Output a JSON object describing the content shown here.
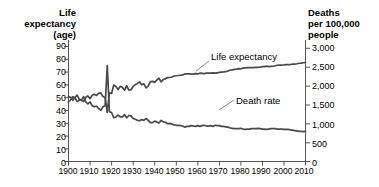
{
  "left_axis": {
    "header_lines": [
      "Life",
      "expectancy",
      "(age)"
    ],
    "ticks": [
      "90",
      "80",
      "70",
      "60",
      "50",
      "40",
      "30",
      "20",
      "10",
      "0"
    ]
  },
  "right_axis": {
    "header_lines": [
      "Deaths",
      "per 100,000",
      "people"
    ],
    "ticks": [
      "3,000",
      "2,500",
      "2,000",
      "1,500",
      "1,000",
      "500",
      "0"
    ]
  },
  "x_axis": {
    "ticks": [
      "1900",
      "1910",
      "1920",
      "1930",
      "1940",
      "1950",
      "1960",
      "1970",
      "1980",
      "1990",
      "2000",
      "2010"
    ]
  },
  "annotations": {
    "life_expectancy": "Life expectancy",
    "death_rate": "Death rate"
  },
  "caption_fragment": "",
  "colors": {
    "line": "#4a4a4a",
    "axis": "#555555",
    "text": "#000000",
    "background": "#ffffff"
  },
  "chart_data": {
    "type": "line",
    "title": "",
    "subtitle": "",
    "xlabel": "",
    "ylabel": "Life expectancy (age)",
    "y2label": "Deaths per 100,000 people",
    "grid": false,
    "legend": "inline-annotations",
    "xlim": [
      1900,
      2010
    ],
    "ylim": [
      0,
      90
    ],
    "y2lim": [
      0,
      3000
    ],
    "xticks": [
      1900,
      1910,
      1920,
      1930,
      1940,
      1950,
      1960,
      1970,
      1980,
      1990,
      2000,
      2010
    ],
    "yticks": [
      0,
      10,
      20,
      30,
      40,
      50,
      60,
      70,
      80,
      90
    ],
    "y2ticks": [
      0,
      500,
      1000,
      1500,
      2000,
      2500,
      3000
    ],
    "series": [
      {
        "name": "Life expectancy",
        "axis": "right",
        "unit": "deaths per 100,000 people",
        "note": "Plotted against the right-hand axis; rises from about 1,550 to about 2,600 equivalent units. Reads as age 47 to 78 on the left axis.",
        "x": [
          1900,
          1901,
          1902,
          1903,
          1904,
          1905,
          1906,
          1907,
          1908,
          1909,
          1910,
          1911,
          1912,
          1913,
          1914,
          1915,
          1916,
          1917,
          1918,
          1919,
          1920,
          1921,
          1922,
          1923,
          1924,
          1925,
          1926,
          1927,
          1928,
          1929,
          1930,
          1931,
          1932,
          1933,
          1934,
          1935,
          1936,
          1937,
          1938,
          1939,
          1940,
          1941,
          1942,
          1943,
          1944,
          1945,
          1946,
          1947,
          1948,
          1949,
          1950,
          1951,
          1952,
          1953,
          1954,
          1955,
          1956,
          1957,
          1958,
          1959,
          1960,
          1961,
          1962,
          1963,
          1964,
          1965,
          1966,
          1967,
          1968,
          1969,
          1970,
          1971,
          1972,
          1973,
          1974,
          1975,
          1976,
          1977,
          1978,
          1979,
          1980,
          1981,
          1982,
          1983,
          1984,
          1985,
          1986,
          1987,
          1988,
          1989,
          1990,
          1991,
          1992,
          1993,
          1994,
          1995,
          1996,
          1997,
          1998,
          1999,
          2000,
          2001,
          2002,
          2003,
          2004,
          2005,
          2006,
          2007,
          2008,
          2009,
          2010
        ],
        "values_left_axis": [
          47.3,
          49.1,
          51.5,
          50.5,
          47.6,
          48.7,
          48.7,
          47.6,
          51.1,
          52.1,
          50.0,
          52.6,
          53.5,
          52.5,
          54.2,
          54.5,
          51.7,
          50.9,
          39.1,
          54.7,
          54.1,
          60.8,
          59.6,
          57.2,
          59.7,
          59.0,
          56.7,
          60.4,
          56.8,
          57.1,
          59.7,
          61.1,
          62.1,
          63.3,
          61.1,
          61.7,
          58.5,
          60.0,
          63.5,
          63.7,
          62.9,
          64.8,
          66.2,
          63.3,
          65.2,
          65.9,
          66.7,
          66.8,
          67.2,
          68.0,
          68.2,
          68.4,
          68.6,
          68.8,
          69.6,
          69.6,
          69.7,
          69.5,
          69.6,
          69.9,
          69.7,
          70.2,
          70.1,
          69.9,
          70.2,
          70.2,
          70.2,
          70.5,
          70.2,
          70.5,
          70.8,
          71.1,
          71.2,
          71.4,
          72.0,
          72.6,
          72.9,
          73.3,
          73.5,
          73.9,
          73.7,
          74.2,
          74.5,
          74.6,
          74.7,
          74.7,
          74.7,
          74.9,
          74.9,
          75.1,
          75.4,
          75.5,
          75.8,
          75.5,
          75.7,
          75.8,
          76.1,
          76.5,
          76.7,
          76.7,
          76.8,
          77.0,
          77.0,
          77.1,
          77.5,
          77.4,
          77.7,
          78.1,
          78.2,
          78.5,
          78.7
        ]
      },
      {
        "name": "Death rate",
        "axis": "right",
        "unit": "deaths per 100,000 people",
        "note": "Age-adjusted style crude death rate; spikes to about 2,540 in 1918 (influenza pandemic) then declines steadily.",
        "x": [
          1900,
          1901,
          1902,
          1903,
          1904,
          1905,
          1906,
          1907,
          1908,
          1909,
          1910,
          1911,
          1912,
          1913,
          1914,
          1915,
          1916,
          1917,
          1918,
          1919,
          1920,
          1921,
          1922,
          1923,
          1924,
          1925,
          1926,
          1927,
          1928,
          1929,
          1930,
          1931,
          1932,
          1933,
          1934,
          1935,
          1936,
          1937,
          1938,
          1939,
          1940,
          1941,
          1942,
          1943,
          1944,
          1945,
          1946,
          1947,
          1948,
          1949,
          1950,
          1951,
          1952,
          1953,
          1954,
          1955,
          1956,
          1957,
          1958,
          1959,
          1960,
          1961,
          1962,
          1963,
          1964,
          1965,
          1966,
          1967,
          1968,
          1969,
          1970,
          1971,
          1972,
          1973,
          1974,
          1975,
          1976,
          1977,
          1978,
          1979,
          1980,
          1981,
          1982,
          1983,
          1984,
          1985,
          1986,
          1987,
          1988,
          1989,
          1990,
          1991,
          1992,
          1993,
          1994,
          1995,
          1996,
          1997,
          1998,
          1999,
          2000,
          2001,
          2002,
          2003,
          2004,
          2005,
          2006,
          2007,
          2008,
          2009,
          2010
        ],
        "values": [
          1720,
          1700,
          1620,
          1700,
          1760,
          1650,
          1630,
          1720,
          1580,
          1530,
          1580,
          1480,
          1450,
          1470,
          1400,
          1360,
          1450,
          1480,
          2540,
          1320,
          1300,
          1160,
          1180,
          1230,
          1180,
          1180,
          1240,
          1160,
          1220,
          1210,
          1140,
          1120,
          1090,
          1080,
          1110,
          1090,
          1140,
          1090,
          1030,
          1030,
          1070,
          1050,
          1020,
          1090,
          1050,
          1040,
          1000,
          1010,
          990,
          970,
          960,
          960,
          950,
          940,
          910,
          930,
          930,
          950,
          940,
          930,
          950,
          930,
          950,
          960,
          940,
          940,
          950,
          930,
          960,
          950,
          950,
          930,
          930,
          920,
          910,
          890,
          880,
          870,
          870,
          870,
          880,
          860,
          850,
          860,
          860,
          870,
          870,
          870,
          880,
          870,
          860,
          860,
          850,
          860,
          870,
          870,
          870,
          860,
          860,
          860,
          850,
          850,
          850,
          840,
          830,
          820,
          810,
          800,
          800,
          790,
          800
        ]
      }
    ]
  }
}
